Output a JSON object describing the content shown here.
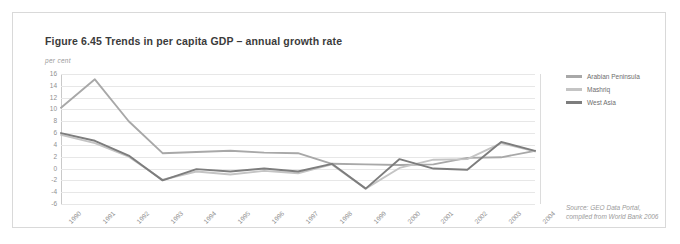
{
  "figure": {
    "title": "Figure 6.45 Trends in per capita GDP – annual growth rate",
    "unit_label": "per cent",
    "source_line1": "Source: GEO Data Portal,",
    "source_line2": "compiled from World Bank 2006"
  },
  "colors": {
    "arabian_peninsula": "#a8a8a8",
    "mashriq": "#c4c4c4",
    "west_asia": "#7d7d7d",
    "grid": "#e7e7e7",
    "axis": "#c9c9c9",
    "tick_text": "#8f8f8f",
    "title_text": "#3b3b3b"
  },
  "chart_data": {
    "type": "line",
    "title": "Figure 6.45 Trends in per capita GDP – annual growth rate",
    "xlabel": "",
    "ylabel": "per cent",
    "ylim": [
      -6,
      16
    ],
    "ytick_step": 2,
    "yticks": [
      16,
      14,
      12,
      10,
      8,
      6,
      4,
      2,
      0,
      -2,
      -4,
      -6
    ],
    "grid": true,
    "legend_position": "right",
    "categories": [
      "1990",
      "1991",
      "1992",
      "1993",
      "1994",
      "1995",
      "1996",
      "1997",
      "1998",
      "1999",
      "2000",
      "2001",
      "2002",
      "2003",
      "2004"
    ],
    "series": [
      {
        "name": "Arabian Peninsula",
        "color": "#a8a8a8",
        "values": [
          10.3,
          15.1,
          8.0,
          2.6,
          2.8,
          3.0,
          2.7,
          2.6,
          0.8,
          0.7,
          0.6,
          0.7,
          1.8,
          1.9,
          3.0
        ]
      },
      {
        "name": "Mashriq",
        "color": "#c4c4c4",
        "values": [
          5.7,
          4.3,
          2.0,
          -1.9,
          -0.5,
          -1.0,
          -0.4,
          -0.8,
          0.7,
          -3.4,
          0.1,
          1.5,
          1.6,
          4.3,
          2.9
        ]
      },
      {
        "name": "West Asia",
        "color": "#7d7d7d",
        "values": [
          6.0,
          4.7,
          2.2,
          -2.0,
          -0.1,
          -0.5,
          0.0,
          -0.5,
          0.8,
          -3.4,
          1.6,
          0.0,
          -0.2,
          4.5,
          3.0
        ]
      }
    ]
  },
  "legend": {
    "items": [
      {
        "label": "Arabian Peninsula",
        "color": "#a8a8a8"
      },
      {
        "label": "Mashriq",
        "color": "#c4c4c4"
      },
      {
        "label": "West Asia",
        "color": "#7d7d7d"
      }
    ]
  }
}
